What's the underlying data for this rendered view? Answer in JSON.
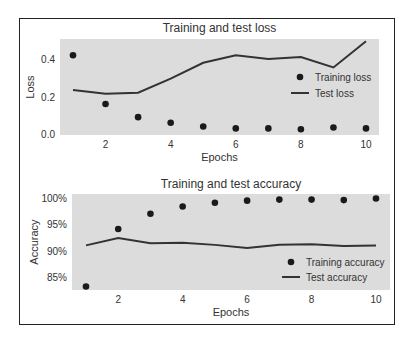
{
  "chart_data": [
    {
      "type": "line",
      "title": "Training and test loss",
      "xlabel": "Epochs",
      "ylabel": "Loss",
      "x": [
        1,
        2,
        3,
        4,
        5,
        6,
        7,
        8,
        9,
        10
      ],
      "xticks": [
        2,
        4,
        6,
        8,
        10
      ],
      "yticks": [
        0.0,
        0.2,
        0.4
      ],
      "ytick_labels": [
        "0.0",
        "0.2",
        "0.4"
      ],
      "ylim": [
        0.0,
        0.5
      ],
      "grid": false,
      "legend_position": "center right",
      "series": [
        {
          "name": "Training loss",
          "style": "dots",
          "values": [
            0.42,
            0.16,
            0.09,
            0.06,
            0.04,
            0.03,
            0.03,
            0.025,
            0.035,
            0.03
          ]
        },
        {
          "name": "Test loss",
          "style": "line",
          "values": [
            0.235,
            0.215,
            0.22,
            0.295,
            0.38,
            0.42,
            0.4,
            0.41,
            0.355,
            0.495
          ]
        }
      ]
    },
    {
      "type": "line",
      "title": "Training and test accuracy",
      "xlabel": "Epochs",
      "ylabel": "Accuracy",
      "x": [
        1,
        2,
        3,
        4,
        5,
        6,
        7,
        8,
        9,
        10
      ],
      "xticks": [
        2,
        4,
        6,
        8,
        10
      ],
      "yticks": [
        85,
        90,
        95,
        100
      ],
      "ytick_labels": [
        "85%",
        "90%",
        "95%",
        "100%"
      ],
      "ylim": [
        82.5,
        100.5
      ],
      "grid": false,
      "legend_position": "lower right",
      "series": [
        {
          "name": "Training accuracy",
          "style": "dots",
          "values": [
            83.2,
            94.1,
            97.0,
            98.4,
            99.1,
            99.5,
            99.7,
            99.7,
            99.6,
            99.9
          ]
        },
        {
          "name": "Test accuracy",
          "style": "line",
          "values": [
            91.0,
            92.4,
            91.4,
            91.5,
            91.1,
            90.5,
            91.1,
            91.2,
            90.9,
            91.0
          ]
        }
      ]
    }
  ]
}
